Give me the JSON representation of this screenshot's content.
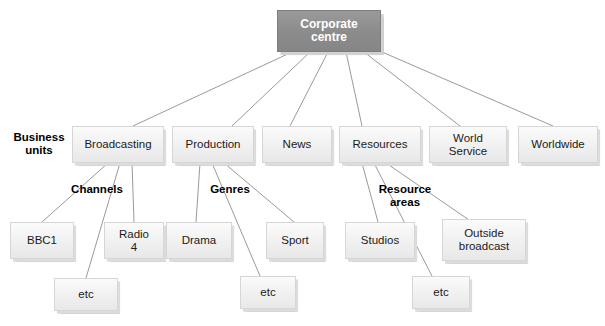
{
  "diagram": {
    "background_color": "#ffffff",
    "root_box_color": "#8c8c8c",
    "box_color": "#f2f2f2",
    "line_color": "#9a9a9a",
    "root": {
      "label": "Corporate\ncentre"
    },
    "row_labels": {
      "business_units": "Business\nunits",
      "channels": "Channels",
      "genres": "Genres",
      "resource_areas": "Resource\nareas"
    },
    "business_units": [
      {
        "label": "Broadcasting"
      },
      {
        "label": "Production"
      },
      {
        "label": "News"
      },
      {
        "label": "Resources"
      },
      {
        "label": "World\nService"
      },
      {
        "label": "Worldwide"
      }
    ],
    "channels": [
      {
        "label": "BBC1"
      },
      {
        "label": "Radio\n4"
      },
      {
        "label": "etc"
      }
    ],
    "genres": [
      {
        "label": "Drama"
      },
      {
        "label": "Sport"
      },
      {
        "label": "etc"
      }
    ],
    "resource_areas": [
      {
        "label": "Studios"
      },
      {
        "label": "Outside\nbroadcast"
      },
      {
        "label": "etc"
      }
    ]
  }
}
